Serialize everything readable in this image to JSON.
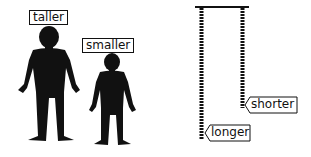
{
  "diagram": {
    "left_panel": {
      "tall_person_label": "taller",
      "short_person_label": "smaller"
    },
    "right_panel": {
      "short_chain_label": "shorter",
      "long_chain_label": "longer"
    },
    "colors": {
      "ink": "#111111",
      "background": "#ffffff"
    }
  }
}
